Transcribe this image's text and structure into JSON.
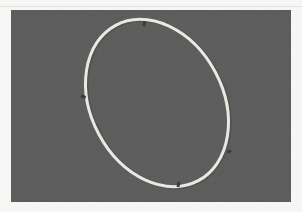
{
  "image": {
    "description": "Photograph of a thin pale segmented ring laid as a tilted ellipse on a dark gray background",
    "colors": {
      "border": "#f6f6f4",
      "background": "#575757",
      "ring": "#e8e8e0",
      "gap_marks": "#3a3a3a"
    },
    "subject": "segmented-ring",
    "segment_count": 4
  }
}
